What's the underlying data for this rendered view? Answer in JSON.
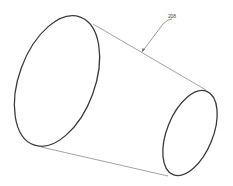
{
  "figure": {
    "type": "patent-style line drawing",
    "reference_label": "208",
    "colors": {
      "background": "#ffffff",
      "outline": "#3a3a3a",
      "edge_lines": "#7a7a7a"
    }
  }
}
